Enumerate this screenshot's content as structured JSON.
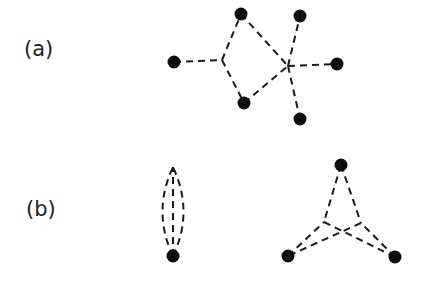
{
  "panels": [
    {
      "label": "(a)",
      "label_pos": [
        24,
        37
      ],
      "nodes": [
        [
          174,
          62
        ],
        [
          241,
          14
        ],
        [
          300,
          16
        ],
        [
          337,
          64
        ],
        [
          244,
          103
        ],
        [
          300,
          119
        ]
      ],
      "vertices": [
        [
          222,
          60
        ],
        [
          288,
          66
        ]
      ],
      "edges": [
        [
          [
            174,
            62
          ],
          [
            222,
            60
          ]
        ],
        [
          [
            222,
            60
          ],
          [
            241,
            14
          ]
        ],
        [
          [
            222,
            60
          ],
          [
            244,
            103
          ]
        ],
        [
          [
            241,
            14
          ],
          [
            288,
            66
          ]
        ],
        [
          [
            244,
            103
          ],
          [
            288,
            66
          ]
        ],
        [
          [
            288,
            66
          ],
          [
            300,
            16
          ]
        ],
        [
          [
            288,
            66
          ],
          [
            337,
            64
          ]
        ],
        [
          [
            288,
            66
          ],
          [
            300,
            119
          ]
        ]
      ]
    },
    {
      "label": "(b)",
      "label_pos": [
        26,
        197
      ],
      "nodes": [
        [
          173,
          256
        ],
        [
          341,
          165
        ],
        [
          288,
          256
        ],
        [
          395,
          257
        ]
      ],
      "vertices": [
        [
          173,
          167
        ],
        [
          324,
          222
        ],
        [
          361,
          223
        ]
      ],
      "curved_edges": [
        "M173,256 L173,167",
        "M173,256 Q152,212 173,167",
        "M173,256 Q194,212 173,167"
      ],
      "edges": [
        [
          [
            341,
            165
          ],
          [
            324,
            222
          ]
        ],
        [
          [
            341,
            165
          ],
          [
            361,
            223
          ]
        ],
        [
          [
            288,
            256
          ],
          [
            324,
            222
          ]
        ],
        [
          [
            395,
            257
          ],
          [
            361,
            223
          ]
        ],
        [
          [
            324,
            222
          ],
          [
            395,
            257
          ]
        ],
        [
          [
            361,
            223
          ],
          [
            288,
            256
          ]
        ]
      ]
    }
  ]
}
